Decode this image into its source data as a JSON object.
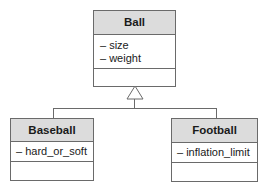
{
  "diagram": {
    "type": "uml-class-diagram",
    "relationship": "generalization",
    "classes": [
      {
        "name": "Ball",
        "attributes": [
          "– size",
          "– weight"
        ],
        "operations": []
      },
      {
        "name": "Baseball",
        "attributes": [
          "– hard_or_soft"
        ],
        "operations": []
      },
      {
        "name": "Football",
        "attributes": [
          "– inflation_limit"
        ],
        "operations": []
      }
    ],
    "colors": {
      "header_fill": "#dcdcdc",
      "border": "#6a6a6a",
      "background": "#ffffff"
    }
  }
}
